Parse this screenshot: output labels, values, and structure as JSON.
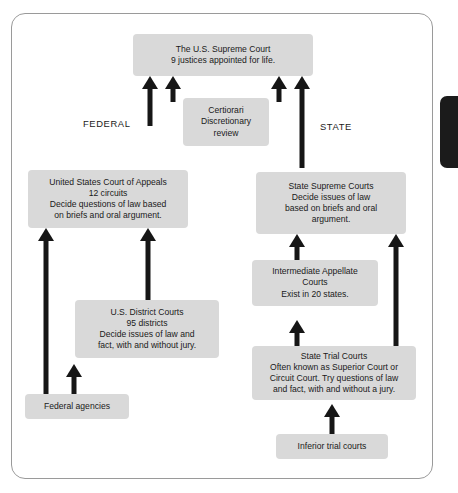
{
  "diagram": {
    "side_labels": {
      "federal": "FEDERAL",
      "state": "STATE"
    },
    "nodes": {
      "supreme_court": "The U.S. Supreme Court\n9 justices appointed for life.",
      "certiorari": "Certiorari\nDiscretionary\nreview",
      "court_of_appeals": "United States Court of Appeals\n12 circuits\nDecide questions of law based\non briefs and oral argument.",
      "state_supreme_courts": "State Supreme Courts\nDecide issues of law\nbased on briefs and oral\nargument.",
      "district_courts": "U.S. District Courts\n95 districts\nDecide issues of law and\nfact, with and without jury.",
      "intermediate_appellate": "Intermediate Appellate\nCourts\nExist in 20 states.",
      "state_trial_courts": "State Trial Courts\nOften known as Superior Court or\nCircuit Court. Try questions of law\nand fact, with and without a jury.",
      "federal_agencies": "Federal agencies",
      "inferior_trial_courts": "Inferior trial courts"
    },
    "colors": {
      "node_fill": "#d9d9d9",
      "arrow": "#161616",
      "frame_border": "#9a9a9a",
      "tab": "#1b1b1b",
      "background": "#ffffff",
      "text": "#1a1a1a"
    }
  }
}
